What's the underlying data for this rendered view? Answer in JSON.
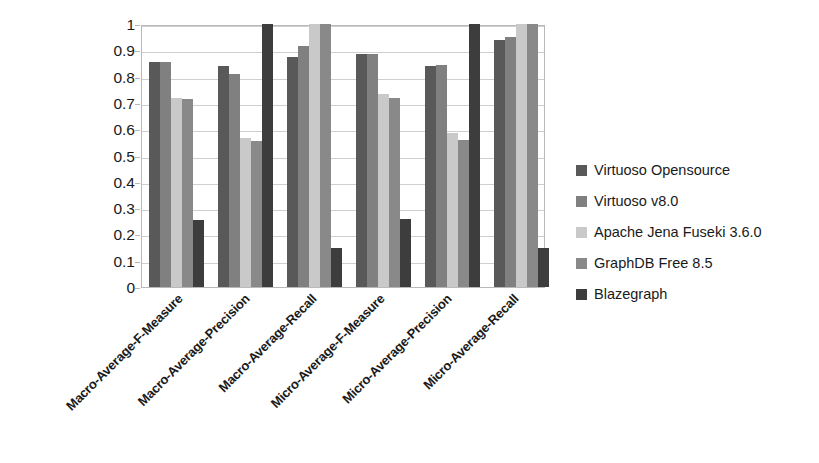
{
  "chart_data": {
    "type": "bar",
    "title": "",
    "subtitle": "",
    "xlabel": "",
    "ylabel": "",
    "ylim": [
      0,
      1
    ],
    "grid": true,
    "legend_position": "right",
    "orientation": "vertical",
    "grouping": "clustered",
    "y_ticks": [
      "0",
      "0.1",
      "0.2",
      "0.3",
      "0.4",
      "0.5",
      "0.6",
      "0.7",
      "0.8",
      "0.9",
      "1"
    ],
    "y_tick_values": [
      0,
      0.1,
      0.2,
      0.3,
      0.4,
      0.5,
      0.6,
      0.7,
      0.8,
      0.9,
      1
    ],
    "categories": [
      "Macro-Average-F-Measure",
      "Macro-Average-Precision",
      "Macro-Average-Recall",
      "Micro-Average-F-Measure",
      "Micro-Average-Precision",
      "Micro-Average-Recall"
    ],
    "series": [
      {
        "name": "Virtuoso Opensource",
        "color": "#595959",
        "values": [
          0.855,
          0.84,
          0.875,
          0.885,
          0.84,
          0.94
        ]
      },
      {
        "name": "Virtuoso v8.0",
        "color": "#808080",
        "values": [
          0.855,
          0.81,
          0.915,
          0.885,
          0.845,
          0.95
        ]
      },
      {
        "name": "Apache Jena Fuseki 3.6.0",
        "color": "#c9c9c9",
        "values": [
          0.72,
          0.565,
          1.0,
          0.735,
          0.585,
          1.0
        ]
      },
      {
        "name": "GraphDB Free 8.5",
        "color": "#898989",
        "values": [
          0.715,
          0.555,
          1.0,
          0.72,
          0.56,
          1.0
        ]
      },
      {
        "name": "Blazegraph",
        "color": "#3d3d3d",
        "values": [
          0.255,
          1.0,
          0.15,
          0.26,
          1.0,
          0.15
        ]
      }
    ]
  },
  "legend": {
    "items": [
      {
        "label": "Virtuoso Opensource",
        "color": "#595959"
      },
      {
        "label": "Virtuoso v8.0",
        "color": "#808080"
      },
      {
        "label": "Apache Jena Fuseki 3.6.0",
        "color": "#c9c9c9"
      },
      {
        "label": "GraphDB Free 8.5",
        "color": "#898989"
      },
      {
        "label": "Blazegraph",
        "color": "#3d3d3d"
      }
    ]
  },
  "colors": {
    "background": "#ffffff",
    "gridline": "#cfcfcf",
    "plot_border": "#b9b9b9",
    "text": "#1a1a1a"
  }
}
